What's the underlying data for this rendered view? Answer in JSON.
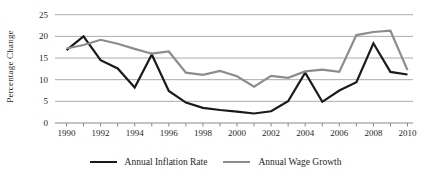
{
  "chart_data": {
    "type": "line",
    "title": "",
    "xlabel": "",
    "ylabel": "Percentage Change",
    "ylim": [
      0,
      25
    ],
    "yticks": [
      0,
      5,
      10,
      15,
      20,
      25
    ],
    "xticks": [
      1990,
      1992,
      1994,
      1996,
      1998,
      2000,
      2002,
      2004,
      2006,
      2008,
      2010
    ],
    "x": [
      1990,
      1991,
      1992,
      1993,
      1994,
      1995,
      1996,
      1997,
      1998,
      1999,
      2000,
      2001,
      2002,
      2003,
      2004,
      2005,
      2006,
      2007,
      2008,
      2009,
      2010
    ],
    "series": [
      {
        "name": "Annual Inflation Rate",
        "color": "#1a1a1a",
        "values": [
          16.8,
          20.0,
          14.5,
          12.6,
          8.2,
          15.8,
          7.4,
          4.7,
          3.5,
          3.0,
          2.6,
          2.2,
          2.7,
          5.0,
          11.6,
          4.9,
          7.5,
          9.4,
          18.4,
          11.8,
          11.2
        ]
      },
      {
        "name": "Annual Wage Growth",
        "color": "#8c8c8c",
        "values": [
          17.2,
          18.0,
          19.2,
          18.3,
          17.1,
          16.0,
          16.5,
          11.6,
          11.1,
          12.0,
          10.8,
          8.4,
          10.9,
          10.4,
          11.9,
          12.3,
          11.8,
          20.3,
          21.0,
          21.3,
          12.2
        ]
      }
    ],
    "grid": "horizontal",
    "legend_position": "bottom",
    "colors": {
      "gridline": "#ababab",
      "axis": "#8a8a8a",
      "text": "#1f1f1f",
      "background": "#ffffff"
    }
  }
}
